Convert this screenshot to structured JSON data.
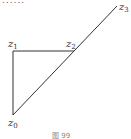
{
  "top_text": "......",
  "diagram": {
    "points": [
      {
        "name": "z",
        "sub": "0",
        "x": 13,
        "y": 115,
        "label_x": 8,
        "label_y": 126
      },
      {
        "name": "z",
        "sub": "1",
        "x": 13,
        "y": 51,
        "label_x": 8,
        "label_y": 47
      },
      {
        "name": "z",
        "sub": "2",
        "x": 74,
        "y": 51,
        "label_x": 66,
        "label_y": 47
      },
      {
        "name": "z",
        "sub": "3",
        "x": 117,
        "y": 6,
        "label_x": 119,
        "label_y": 10
      }
    ],
    "line_color": "#333333"
  },
  "caption": "图 99"
}
